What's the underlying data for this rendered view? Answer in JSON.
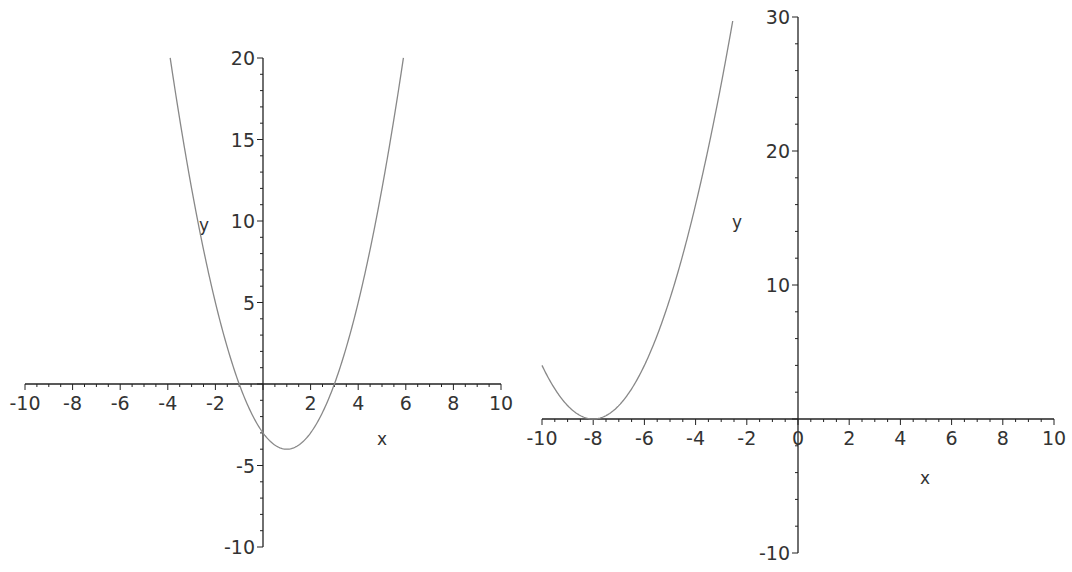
{
  "chart_data": [
    {
      "type": "line",
      "title": "",
      "function": "y = x^2 - 2x - 3",
      "xlabel": "x",
      "ylabel": "y",
      "xlim": [
        -10,
        10
      ],
      "ylim": [
        -10,
        20
      ],
      "xticks": [
        -10,
        -8,
        -6,
        -4,
        -2,
        2,
        4,
        6,
        8,
        10
      ],
      "yticks": [
        -10,
        -5,
        5,
        10,
        15,
        20
      ],
      "x_range_plotted": [
        -3.9,
        5.9
      ],
      "grid": false,
      "legend": null,
      "color": "#888888",
      "layout": {
        "x0": 263,
        "y0": 384,
        "px_per_x": 23.8,
        "px_per_y": 16.3
      }
    },
    {
      "type": "line",
      "title": "",
      "function": "y = (x + 8)^2",
      "xlabel": "x",
      "ylabel": "y",
      "xlim": [
        -10,
        10
      ],
      "ylim": [
        -10,
        30
      ],
      "xticks": [
        -10,
        -8,
        -6,
        -4,
        -2,
        0,
        2,
        4,
        6,
        8,
        10
      ],
      "yticks": [
        -10,
        10,
        20,
        30
      ],
      "x_range_plotted": [
        -10,
        -2.55
      ],
      "grid": false,
      "legend": null,
      "color": "#888888",
      "layout": {
        "x0": 798,
        "y0": 419,
        "px_per_x": 25.6,
        "px_per_y": 13.4
      }
    }
  ],
  "plots": {
    "left": {
      "xlabel": "x",
      "ylabel": "y",
      "xtick_labels": [
        "-10",
        "-8",
        "-6",
        "-4",
        "-2",
        "2",
        "4",
        "6",
        "8",
        "10"
      ],
      "ytick_labels": [
        "-10",
        "-5",
        "5",
        "10",
        "15",
        "20"
      ]
    },
    "right": {
      "xlabel": "x",
      "ylabel": "y",
      "xtick_labels": [
        "-10",
        "-8",
        "-6",
        "-4",
        "-2",
        "0",
        "2",
        "4",
        "6",
        "8",
        "10"
      ],
      "ytick_labels": [
        "-10",
        "10",
        "20",
        "30"
      ]
    }
  }
}
